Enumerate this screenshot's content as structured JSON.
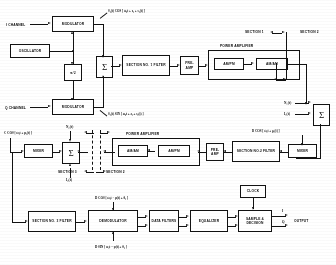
{
  "diagram": {
    "ink_color": "#1a1a1a",
    "paper_color": "#fdfdfb"
  },
  "transmitter": {
    "i_channel_label": "I CHANNEL",
    "q_channel_label": "Q CHANNEL",
    "modulator_i_label": "MODULATOR",
    "modulator_q_label": "MODULATOR",
    "oscillator_label": "OSCILLATOR",
    "phase_shift_label": "π/2",
    "sum_symbol": "Σ",
    "filter_label": "SECTION NO. 1 FILTER",
    "preamp_label": "PRE- AMP",
    "power_amplifier_label": "POWER AMPLIFIER",
    "ampm_label": "AM/PM",
    "amam_label": "AM/AM",
    "eq_i": "S₁(t) COS [ ω₀t + z₁ + s₁(t) ]",
    "eq_q": "S₂(t) SIN [ ω₀t + z₂ + s₂(t) ]",
    "section_1_label": "SECTION 1",
    "section_2_label": "SECTION 2"
  },
  "channel": {
    "sum_symbol": "Σ",
    "noise_1_label": "N₁(t)",
    "noise_2_label": "I₁(t)",
    "interference_top_label": "N₂(t)",
    "interference_bottom_label": "I₂(t)",
    "eq_c": "C COS [ ω₂t + μ₂(t) ]",
    "eq_b": "B COS [ ω₁t + ρ₁(t) ]",
    "eq_d": "D COS [ ω₂t − μ(t) + θ₁ ]"
  },
  "receiver": {
    "mixer_top_label": "MIXER",
    "mixer_bottom_label": "MIXER",
    "sum_symbol": "Σ",
    "power_amplifier_label": "POWER AMPLIFIER",
    "amam_label": "AM/AM",
    "ampm_label": "AM/PM",
    "preamp_label": "PRE- AMP",
    "filter_2_label": "SECTION NO.2 FILTER",
    "filter_3_label": "SECTION NO. 3 FILTER",
    "demodulator_label": "DEMODULATOR",
    "data_filters_label": "DATA FILTERS",
    "equalizer_label": "EQUALIZER",
    "sample_decision_label": "SAMPLE & DECISION",
    "clock_label": "CLOCK",
    "output_label": "OUTPUT",
    "out_i_label": "I",
    "out_q_label": "Q",
    "section_1_label": "SECTION 1",
    "section_2_label": "SECTION 2",
    "section_3_label": "SECTION 3",
    "eq_cos": "D COS [ ω₂t − μ(t) + θ₁ ]",
    "eq_sin": "D SIN [ ω₂t − μ(t) + θ₂ ]"
  }
}
